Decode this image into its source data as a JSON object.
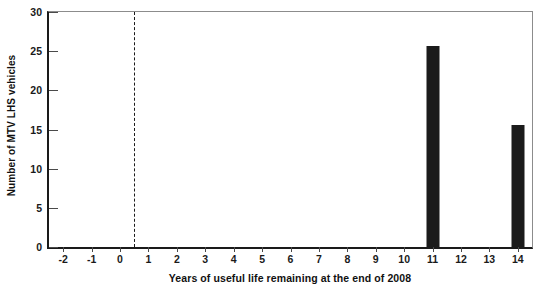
{
  "chart_data": {
    "type": "bar",
    "title": "",
    "subtitle": "",
    "xlabel": "Years of useful life remaining at the end of 2008",
    "ylabel": "Number of MTV LHS vehicles",
    "categories": [
      "-2",
      "-1",
      "0",
      "1",
      "2",
      "3",
      "4",
      "5",
      "6",
      "7",
      "8",
      "9",
      "10",
      "11",
      "12",
      "13",
      "14"
    ],
    "values": [
      0,
      0,
      0,
      0,
      0,
      0,
      0,
      0,
      0,
      0,
      0,
      0,
      0,
      25.6,
      0,
      0,
      15.6
    ],
    "xlim": [
      -2.5,
      14.5
    ],
    "ylim": [
      0,
      30
    ],
    "xticks": [
      "-2",
      "-1",
      "0",
      "1",
      "2",
      "3",
      "4",
      "5",
      "6",
      "7",
      "8",
      "9",
      "10",
      "11",
      "12",
      "13",
      "14"
    ],
    "yticks": [
      "0",
      "5",
      "10",
      "15",
      "20",
      "25",
      "30"
    ],
    "grid": false,
    "legend": null,
    "bar_color": "#1b1b1b",
    "axis_color": "#1a1a1a",
    "annotations": [
      {
        "kind": "vertical-dashed-line",
        "x": 0.5,
        "label": ""
      }
    ]
  }
}
